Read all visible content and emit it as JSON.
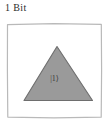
{
  "figure": {
    "caption": "1 Bit",
    "panel": {
      "frame_color": "#b9b9b9",
      "background_color": "#ffffff",
      "shape": {
        "kind": "triangle-icon",
        "fill_color": "#9a9a9a",
        "stroke_color": "#6e6e6e",
        "label": "|1⟩"
      }
    }
  }
}
